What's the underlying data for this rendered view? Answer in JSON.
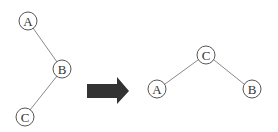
{
  "diagram": {
    "left_tree": {
      "nodes": [
        {
          "id": "A",
          "label": "A",
          "x": 28,
          "y": 21
        },
        {
          "id": "B",
          "label": "B",
          "x": 62,
          "y": 69
        },
        {
          "id": "C",
          "label": "C",
          "x": 25,
          "y": 117
        }
      ],
      "edges": [
        [
          "A",
          "B"
        ],
        [
          "B",
          "C"
        ]
      ]
    },
    "arrow": {
      "direction": "right",
      "color": "#333333"
    },
    "right_tree": {
      "nodes": [
        {
          "id": "C",
          "label": "C",
          "x": 206,
          "y": 55
        },
        {
          "id": "A",
          "label": "A",
          "x": 157,
          "y": 89
        },
        {
          "id": "B",
          "label": "B",
          "x": 252,
          "y": 89
        }
      ],
      "edges": [
        [
          "C",
          "A"
        ],
        [
          "C",
          "B"
        ]
      ]
    }
  }
}
